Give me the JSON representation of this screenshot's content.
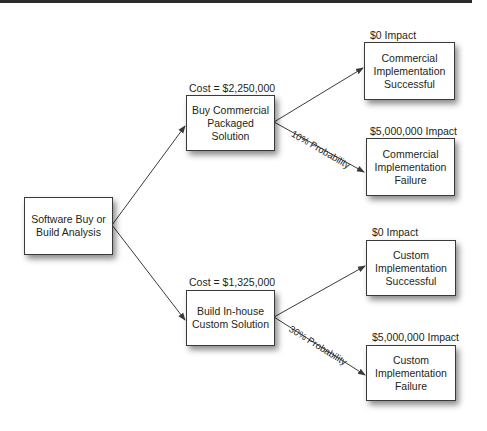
{
  "diagram": {
    "type": "decision-tree",
    "root": {
      "label_line1": "Software Buy or",
      "label_line2": "Build Analysis"
    },
    "options": [
      {
        "cost_label": "Cost = $2,250,000",
        "label_line1": "Buy Commercial",
        "label_line2": "Packaged Solution",
        "failure_probability": "10% Probability",
        "outcomes": [
          {
            "impact": "$0 Impact",
            "line1": "Commercial",
            "line2": "Implementation",
            "line3": "Successful"
          },
          {
            "impact": "$5,000,000 Impact",
            "line1": "Commercial",
            "line2": "Implementation",
            "line3": "Failure"
          }
        ]
      },
      {
        "cost_label": "Cost = $1,325,000",
        "label_line1": "Build In-house",
        "label_line2": "Custom Solution",
        "failure_probability": "30% Probability",
        "outcomes": [
          {
            "impact": "$0 Impact",
            "line1": "Custom",
            "line2": "Implementation",
            "line3": "Successful"
          },
          {
            "impact": "$5,000,000 Impact",
            "line1": "Custom",
            "line2": "Implementation",
            "line3": "Failure"
          }
        ]
      }
    ],
    "colors": {
      "line": "#3a3a3a",
      "text": "#231f20",
      "box_fill": "#ffffff"
    }
  }
}
